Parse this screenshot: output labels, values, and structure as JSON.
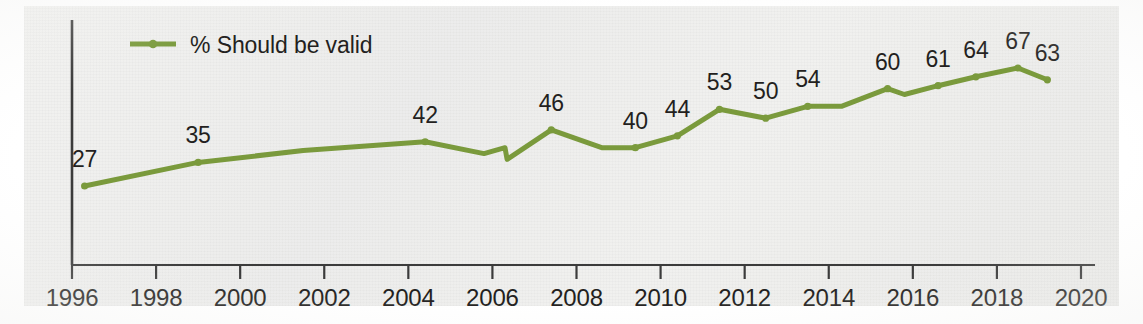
{
  "chart_data": {
    "type": "line",
    "title": "",
    "subtitle": "",
    "xlabel": "",
    "ylabel": "",
    "grid": false,
    "legend_position": "top-left",
    "xlim": [
      1996,
      2020
    ],
    "ylim": [
      20,
      72
    ],
    "xticks": [
      "1996",
      "1998",
      "2000",
      "2002",
      "2004",
      "2006",
      "2008",
      "2010",
      "2012",
      "2014",
      "2016",
      "2018",
      "2020"
    ],
    "series": [
      {
        "name": "% Should be valid",
        "color": "#7a9a3c",
        "has_break": true,
        "break_note": "series discontinuity (vertical jog) at 2006.3",
        "points": [
          {
            "x": 1996.3,
            "y": 27,
            "label": "27",
            "labeled": true
          },
          {
            "x": 1999.0,
            "y": 35,
            "label": "35",
            "labeled": true
          },
          {
            "x": 2001.5,
            "y": 39,
            "label": "",
            "labeled": false
          },
          {
            "x": 2004.4,
            "y": 42,
            "label": "42",
            "labeled": true
          },
          {
            "x": 2005.8,
            "y": 38,
            "label": "",
            "labeled": false
          },
          {
            "x": 2006.3,
            "y": 40,
            "label": "",
            "labeled": false
          },
          {
            "x": 2006.35,
            "y": 36,
            "label": "",
            "labeled": false
          },
          {
            "x": 2007.4,
            "y": 46,
            "label": "46",
            "labeled": true
          },
          {
            "x": 2008.6,
            "y": 40,
            "label": "",
            "labeled": false
          },
          {
            "x": 2009.4,
            "y": 40,
            "label": "40",
            "labeled": true
          },
          {
            "x": 2010.4,
            "y": 44,
            "label": "44",
            "labeled": true
          },
          {
            "x": 2011.4,
            "y": 53,
            "label": "53",
            "labeled": true
          },
          {
            "x": 2012.5,
            "y": 50,
            "label": "50",
            "labeled": true
          },
          {
            "x": 2013.5,
            "y": 54,
            "label": "54",
            "labeled": true
          },
          {
            "x": 2014.3,
            "y": 54,
            "label": "",
            "labeled": false
          },
          {
            "x": 2015.4,
            "y": 60,
            "label": "60",
            "labeled": true
          },
          {
            "x": 2015.8,
            "y": 58,
            "label": "",
            "labeled": false
          },
          {
            "x": 2016.6,
            "y": 61,
            "label": "61",
            "labeled": true
          },
          {
            "x": 2017.5,
            "y": 64,
            "label": "64",
            "labeled": true
          },
          {
            "x": 2018.5,
            "y": 67,
            "label": "67",
            "labeled": true
          },
          {
            "x": 2019.2,
            "y": 63,
            "label": "63",
            "labeled": true
          }
        ]
      }
    ]
  },
  "legend": {
    "entries": [
      {
        "label": "% Should be valid",
        "color": "#7a9a3c"
      }
    ]
  },
  "colors": {
    "line": "#7a9a3c",
    "axis": "#3b3b3b",
    "text": "#231f20",
    "paper": "#efefed"
  }
}
